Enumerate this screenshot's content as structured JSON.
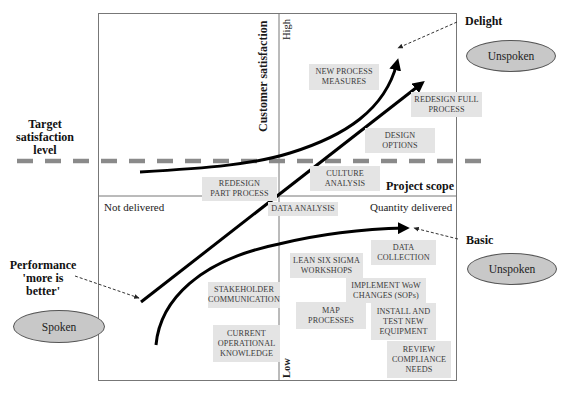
{
  "axes": {
    "y_axis_label": "Customer satisfaction",
    "y_high": "High",
    "y_low": "Low",
    "x_axis_label": "Project scope",
    "x_left": "Not delivered",
    "x_right": "Quantity delivered"
  },
  "side_labels": {
    "target": "Target\nsatisfaction\nlevel",
    "performance": "Performance\n'more is\nbetter'",
    "delight": "Delight",
    "basic": "Basic"
  },
  "ellipses": {
    "unspoken_top": "Unspoken",
    "unspoken_bottom": "Unspoken",
    "spoken": "Spoken"
  },
  "boxes": [
    {
      "label": "NEW PROCESS\nMEASURES"
    },
    {
      "label": "REDESIGN FULL\nPROCESS"
    },
    {
      "label": "DESIGN\nOPTIONS"
    },
    {
      "label": "CULTURE\nANALYSIS"
    },
    {
      "label": "REDESIGN\nPART PROCESS"
    },
    {
      "label": "DATA ANALYSIS"
    },
    {
      "label": "DATA\nCOLLECTION"
    },
    {
      "label": "LEAN SIX SIGMA\nWORKSHOPS"
    },
    {
      "label": "IMPLEMENT WoW\nCHANGES (SOPs)"
    },
    {
      "label": "STAKEHOLDER\nCOMMUNICATION"
    },
    {
      "label": "MAP\nPROCESSES"
    },
    {
      "label": "INSTALL AND\nTEST NEW\nEQUIPMENT"
    },
    {
      "label": "CURRENT\nOPERATIONAL\nKNOWLEDGE"
    },
    {
      "label": "REVIEW\nCOMPLIANCE\nNEEDS"
    }
  ],
  "curves": [
    {
      "name": "Delight",
      "type": "exponential"
    },
    {
      "name": "Performance",
      "type": "linear"
    },
    {
      "name": "Basic",
      "type": "logarithmic"
    }
  ],
  "colors": {
    "box_fill": "#e4e4e4",
    "ellipse_fill": "#c8c8c8",
    "dashed_line": "#8a8a8a",
    "frame": "#777777",
    "curve": "#000000"
  }
}
